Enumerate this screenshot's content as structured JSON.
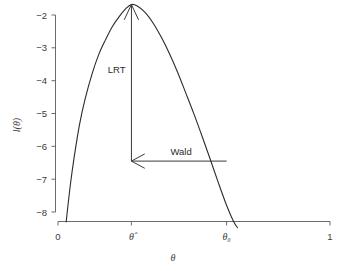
{
  "chart_data": {
    "type": "line",
    "title": "",
    "subtitle": "",
    "xlabel": "θ",
    "ylabel": "l(θ)",
    "xlim": [
      0,
      1
    ],
    "ylim": [
      -8.4,
      -1.5
    ],
    "grid": false,
    "legend": null,
    "x_tick_labels": [
      "0",
      "θ̂",
      "θ₀",
      "1"
    ],
    "x_tick_values": [
      0,
      0.27,
      0.62,
      1
    ],
    "y_tick_labels": [
      "−2",
      "−3",
      "−4",
      "−5",
      "−6",
      "−7",
      "−8"
    ],
    "y_tick_values": [
      -2,
      -3,
      -4,
      -5,
      -6,
      -7,
      -8
    ],
    "series": [
      {
        "name": "log-likelihood",
        "x": [
          0.03,
          0.045,
          0.06,
          0.08,
          0.1,
          0.125,
          0.15,
          0.175,
          0.2,
          0.225,
          0.25,
          0.27,
          0.29,
          0.32,
          0.35,
          0.38,
          0.41,
          0.44,
          0.47,
          0.5,
          0.53,
          0.56,
          0.59,
          0.62,
          0.645,
          0.66
        ],
        "y": [
          -8.3,
          -7.2,
          -6.3,
          -5.3,
          -4.55,
          -3.8,
          -3.2,
          -2.75,
          -2.35,
          -2.05,
          -1.8,
          -1.68,
          -1.72,
          -1.92,
          -2.25,
          -2.68,
          -3.18,
          -3.75,
          -4.38,
          -5.02,
          -5.7,
          -6.4,
          -7.12,
          -7.8,
          -8.28,
          -8.48
        ]
      }
    ],
    "annotations": [
      {
        "label": "LRT",
        "type": "vertical-arrow",
        "x": 0.27,
        "y_from": -6.45,
        "y_to": -1.68,
        "arrowhead": "up"
      },
      {
        "label": "Wald",
        "type": "horizontal-arrow",
        "y": -6.45,
        "x_from": 0.62,
        "x_to": 0.27,
        "arrowhead": "left"
      }
    ],
    "colors": {
      "curve": "#2b2b2b",
      "axis": "#6b6b6b",
      "annotation": "#3a3a3a",
      "background": "#ffffff"
    }
  }
}
